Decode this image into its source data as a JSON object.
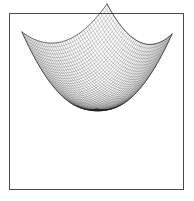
{
  "figure": {
    "background_color": "#ffffff",
    "frame": {
      "visible": true,
      "color": "#4a4a4a",
      "line_width": 1.4,
      "x": 9,
      "y": 13,
      "width": 175,
      "height": 177
    },
    "title": "",
    "caption": ""
  },
  "chart_data": {
    "type": "surface-mesh",
    "title": "",
    "subtitle": "",
    "xlabel": "",
    "ylabel": "",
    "zlabel": "",
    "legend": [],
    "annotations": [],
    "grid": true,
    "axes_visible": false,
    "tick_labels_visible": false,
    "surface": {
      "function": "z = x^2 + y^2",
      "x_range": [
        -1,
        1
      ],
      "y_range": [
        -1,
        1
      ],
      "z_range": [
        0,
        2
      ],
      "grid_rows": 40,
      "grid_cols": 40,
      "wire_color": "#1a1a1a",
      "wire_width": 0.35,
      "face_color": "#ffffff",
      "shading": "wireframe"
    },
    "projection": {
      "type": "oblique-isometric",
      "far_corner_px": [
        107,
        50
      ],
      "near_corner_px": [
        97,
        155
      ],
      "left_corner_px": [
        22,
        78
      ],
      "right_corner_px": [
        172,
        80
      ],
      "center_px": [
        97,
        113
      ],
      "elevation_deg": 30,
      "azimuth_deg": 225
    },
    "corner_heights": [
      2.0,
      2.0,
      2.0,
      2.0
    ],
    "center_height": 0.0
  }
}
